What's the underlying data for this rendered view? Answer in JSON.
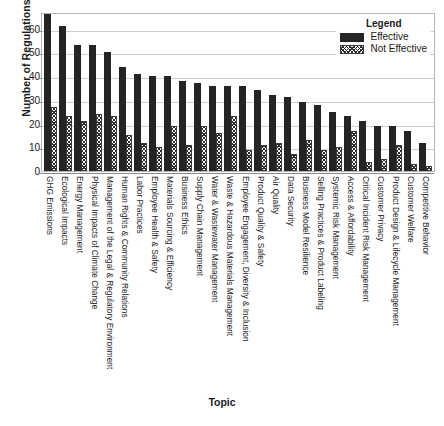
{
  "chart_data": {
    "type": "bar",
    "title": "",
    "xlabel": "Topic",
    "ylabel": "Number of Regulations",
    "ylim": [
      0,
      67
    ],
    "yticks": [
      0,
      10,
      20,
      30,
      40,
      50,
      60
    ],
    "grid": true,
    "legend": {
      "title": "Legend",
      "position": "top-right",
      "entries": [
        {
          "name": "Effective",
          "swatch": "solid-black",
          "color": "#242424"
        },
        {
          "name": "Not Effective",
          "swatch": "crosshatch",
          "color": "#2b2b2b"
        }
      ]
    },
    "categories": [
      "GHG Emissions",
      "Ecological Impacts",
      "Energy Management",
      "Physical Impacts of Climate Change",
      "Management of the Legal & Regulatory Environment",
      "Human Rights & Community Relations",
      "Labor Practices",
      "Employee Health & Safety",
      "Materials Sourcing & Efficiency",
      "Business Ethics",
      "Supply Chain Management",
      "Water & Wastewater Management",
      "Waste & Hazardous Materials Management",
      "Employee Engagement, Diversity & Inclusion",
      "Product Quality & Safety",
      "Air Quality",
      "Data Security",
      "Business Model Resilience",
      "Selling Practices & Product Labeling",
      "Systemic Risk Management",
      "Access & Affordability",
      "Critical Incident Risk Management",
      "Customer Privacy",
      "Product Design & Lifecycle Management",
      "Customer Welfare",
      "Competitive Behavior"
    ],
    "series": [
      {
        "name": "Effective",
        "values": [
          66,
          61,
          53,
          53,
          50,
          44,
          41,
          40,
          40,
          38,
          37,
          36,
          36,
          36,
          34,
          32,
          31,
          29,
          28,
          25,
          23,
          21,
          19,
          19,
          17,
          12
        ]
      },
      {
        "name": "Not Effective",
        "values": [
          27,
          23,
          21,
          24,
          23,
          15,
          12,
          10,
          19,
          11,
          19,
          16,
          23,
          9,
          11,
          12,
          7,
          13,
          9,
          10,
          17,
          4,
          5,
          11,
          3,
          2
        ]
      }
    ]
  }
}
